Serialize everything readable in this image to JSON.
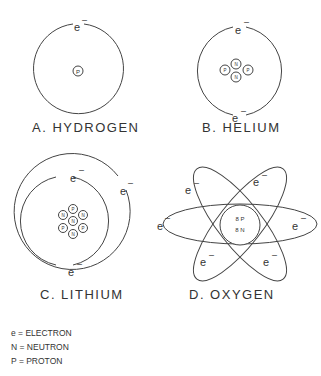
{
  "diagrams": [
    {
      "label": "A. HYDROGEN",
      "nucleus": [
        "P"
      ],
      "electrons": 1
    },
    {
      "label": "B. HELIUM",
      "nucleus": [
        "P",
        "N",
        "N",
        "P"
      ],
      "electrons": 2
    },
    {
      "label": "C. LITHIUM",
      "nucleus": [
        "P",
        "N",
        "N",
        "N",
        "N",
        "P",
        "P"
      ],
      "electrons": 3
    },
    {
      "label": "D. OXYGEN",
      "nucleus": [
        "8 P",
        "8 N"
      ],
      "electrons": 8
    }
  ],
  "electron_symbol": "e",
  "charge_symbol": "–",
  "legend": [
    {
      "text": "e  =  ELECTRON"
    },
    {
      "text": "N  =  NEUTRON"
    },
    {
      "text": "P  =  PROTON"
    }
  ]
}
